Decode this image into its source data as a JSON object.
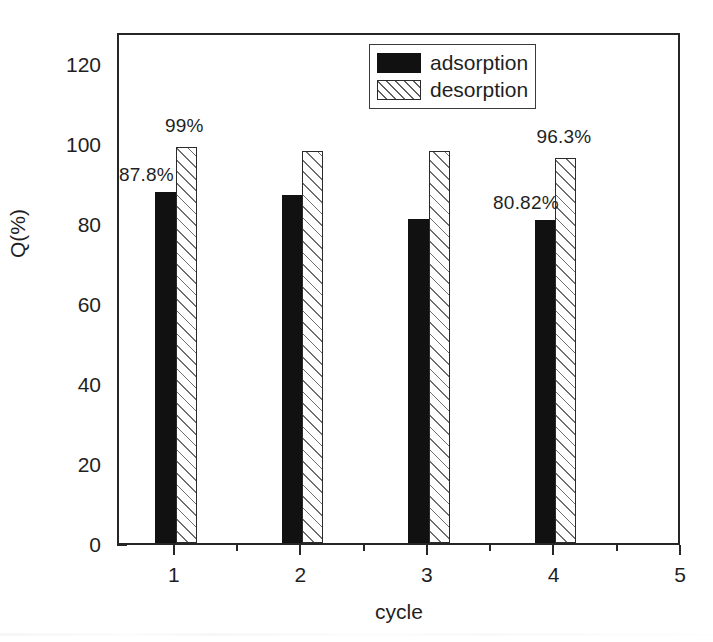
{
  "chart_data": {
    "type": "bar",
    "title": "",
    "subtitle": "",
    "xlabel": "cycle",
    "ylabel": "Q(%)",
    "categories": [
      "1",
      "2",
      "3",
      "4"
    ],
    "series": [
      {
        "name": "adsorption",
        "values": [
          87.8,
          87.0,
          81.0,
          80.82
        ],
        "fill": "solid-black",
        "color": "#111111"
      },
      {
        "name": "desorption",
        "values": [
          99.0,
          98.0,
          98.0,
          96.3
        ],
        "fill": "diagonal-hatch",
        "color": "#ffffff"
      }
    ],
    "data_labels": [
      {
        "text": "87.8%",
        "series": "adsorption",
        "category": "1"
      },
      {
        "text": "99%",
        "series": "desorption",
        "category": "1"
      },
      {
        "text": "80.82%",
        "series": "adsorption",
        "category": "4"
      },
      {
        "text": "96.3%",
        "series": "desorption",
        "category": "4"
      }
    ],
    "xlim": [
      0.55,
      5.0
    ],
    "ylim": [
      0,
      128
    ],
    "ytick_labels": [
      "0",
      "20",
      "40",
      "60",
      "80",
      "100",
      "120"
    ],
    "ytick_values": [
      0,
      20,
      40,
      60,
      80,
      100,
      120
    ],
    "yminor_values": [
      10,
      30,
      50,
      70,
      90,
      110
    ],
    "xtick_labels": [
      "1",
      "2",
      "3",
      "4",
      "5"
    ],
    "xtick_values": [
      1,
      2,
      3,
      4,
      5
    ],
    "xminor_values": [
      1.5,
      2.5,
      3.5,
      4.5
    ],
    "grid": false,
    "legend_position": "top-center-right",
    "legend_entries": [
      "adsorption",
      "desorption"
    ]
  },
  "axes": {
    "y_title": "Q(%)",
    "x_title": "cycle"
  },
  "legend": {
    "entries": [
      {
        "label": "adsorption"
      },
      {
        "label": "desorption"
      }
    ]
  }
}
